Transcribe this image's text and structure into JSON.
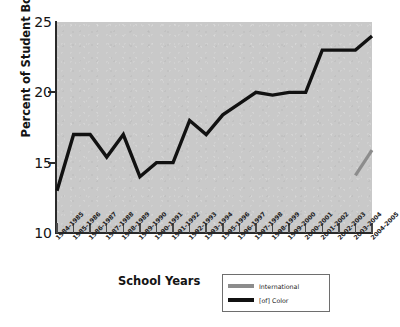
{
  "chart_data": {
    "type": "line",
    "title": "",
    "xlabel": "School Years",
    "ylabel": "Percent of Student Body",
    "ylim": [
      10,
      25
    ],
    "yticks": [
      10,
      15,
      20,
      25
    ],
    "grid": false,
    "legend_position": "bottom-right",
    "categories": [
      "1984-1985",
      "1985-1986",
      "1986-1987",
      "1987-1988",
      "1988-1989",
      "1989-1990",
      "1990-1991",
      "1991-1992",
      "1992-1993",
      "1993-1994",
      "1995-1996",
      "1996-1997",
      "1997-1998",
      "1998-1999",
      "1999-2000",
      "2000-2001",
      "2001-2002",
      "2002-2003",
      "2003-2004",
      "2004-2005"
    ],
    "series": [
      {
        "name": "International",
        "color": "#8c8c8c",
        "values": [
          null,
          null,
          null,
          null,
          null,
          null,
          null,
          null,
          null,
          null,
          null,
          null,
          null,
          null,
          null,
          null,
          null,
          null,
          14.1,
          15.9
        ]
      },
      {
        "name": "[of] Color",
        "color": "#111111",
        "values": [
          13.0,
          17.0,
          17.0,
          15.4,
          17.0,
          14.0,
          15.0,
          15.0,
          18.0,
          17.0,
          18.4,
          19.2,
          20.0,
          19.8,
          20.0,
          20.0,
          23.0,
          23.0,
          23.0,
          24.0
        ]
      }
    ]
  },
  "legend": {
    "items": [
      {
        "label": "International",
        "color": "#8c8c8c"
      },
      {
        "label": "[of] Color",
        "color": "#111111"
      }
    ]
  },
  "axes": {
    "y_title": "Percent of Student Body",
    "x_title": "School Years",
    "y_tick_labels": [
      "25",
      "20",
      "15",
      "10"
    ]
  }
}
